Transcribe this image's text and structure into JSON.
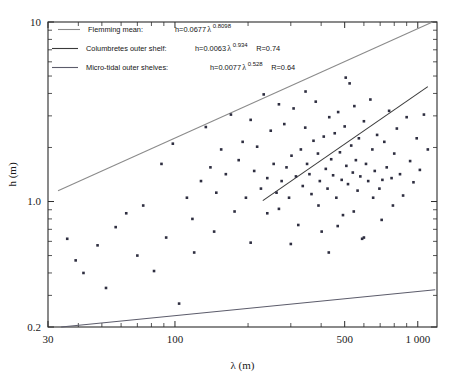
{
  "figure": {
    "background": "#ffffff",
    "frame_color": "#2b2b2b"
  },
  "chart_data": {
    "type": "scatter",
    "title": "",
    "xlabel": "λ (m)",
    "ylabel": "h (m)",
    "xscale": "log",
    "yscale": "log",
    "xlim": [
      30,
      1200
    ],
    "ylim": [
      0.2,
      10
    ],
    "grid": false,
    "xticklabels": [
      "30",
      "100",
      "500",
      "1 000"
    ],
    "xtickvalues": [
      30,
      100,
      500,
      1000
    ],
    "yticklabels": [
      "10",
      "1.0",
      "0.2"
    ],
    "ytickvalues": [
      10,
      1.0,
      0.2
    ],
    "legend_position": "top-left",
    "series": [
      {
        "name": "Flemming mean",
        "type": "line",
        "color": "#8a8a8a",
        "equation": "h=0.0677 λ",
        "exponent": "0.8098",
        "coefficient": 0.0677,
        "r_value": "",
        "x_start": 33,
        "x_end": 1150
      },
      {
        "name": "Columbretes outer shelf",
        "type": "line",
        "color": "#3a3a3a",
        "equation": "h=0.0063λ",
        "exponent": "0.934",
        "coefficient": 0.0063,
        "r_value": "R=0.74",
        "x_start": 230,
        "x_end": 1100
      },
      {
        "name": "Micro-tidal outer shelves",
        "type": "line",
        "color": "#5c5c6b",
        "equation": "h=0.0077 λ",
        "exponent": "0.528",
        "coefficient": 0.0077,
        "r_value": "R=0.64",
        "x_start": 34,
        "x_end": 1180
      },
      {
        "name": "data points",
        "type": "scatter",
        "color": "#2e2e40",
        "points": [
          [
            36,
            0.62
          ],
          [
            39,
            0.47
          ],
          [
            42,
            0.4
          ],
          [
            48,
            0.57
          ],
          [
            52,
            0.33
          ],
          [
            57,
            0.72
          ],
          [
            63,
            0.86
          ],
          [
            70,
            0.5
          ],
          [
            74,
            0.95
          ],
          [
            82,
            0.41
          ],
          [
            88,
            1.62
          ],
          [
            92,
            0.63
          ],
          [
            98,
            2.1
          ],
          [
            104,
            0.27
          ],
          [
            112,
            1.05
          ],
          [
            118,
            0.8
          ],
          [
            128,
            1.3
          ],
          [
            134,
            2.6
          ],
          [
            140,
            1.55
          ],
          [
            148,
            1.12
          ],
          [
            155,
            1.95
          ],
          [
            162,
            1.42
          ],
          [
            170,
            3.05
          ],
          [
            176,
            0.88
          ],
          [
            183,
            1.7
          ],
          [
            190,
            2.15
          ],
          [
            196,
            1.05
          ],
          [
            205,
            0.59
          ],
          [
            212,
            1.48
          ],
          [
            218,
            2.02
          ],
          [
            226,
            1.18
          ],
          [
            232,
            3.95
          ],
          [
            240,
            1.35
          ],
          [
            248,
            2.48
          ],
          [
            255,
            1.62
          ],
          [
            262,
            1.12
          ],
          [
            268,
            0.91
          ],
          [
            275,
            1.3
          ],
          [
            282,
            2.7
          ],
          [
            288,
            1.55
          ],
          [
            295,
            1.05
          ],
          [
            302,
            1.8
          ],
          [
            308,
            3.3
          ],
          [
            315,
            1.38
          ],
          [
            322,
            0.74
          ],
          [
            330,
            1.95
          ],
          [
            336,
            1.22
          ],
          [
            344,
            2.58
          ],
          [
            350,
            1.62
          ],
          [
            358,
            1.42
          ],
          [
            365,
            1.1
          ],
          [
            372,
            2.18
          ],
          [
            380,
            3.6
          ],
          [
            388,
            1.85
          ],
          [
            395,
            1.3
          ],
          [
            402,
            0.68
          ],
          [
            410,
            2.3
          ],
          [
            418,
            1.52
          ],
          [
            425,
            1.18
          ],
          [
            432,
            2.95
          ],
          [
            440,
            1.72
          ],
          [
            448,
            1.4
          ],
          [
            455,
            2.4
          ],
          [
            462,
            1.05
          ],
          [
            470,
            3.15
          ],
          [
            478,
            1.88
          ],
          [
            486,
            1.32
          ],
          [
            492,
            0.84
          ],
          [
            500,
            2.62
          ],
          [
            508,
            1.58
          ],
          [
            516,
            1.25
          ],
          [
            524,
            4.55
          ],
          [
            532,
            2.05
          ],
          [
            540,
            1.45
          ],
          [
            548,
            3.4
          ],
          [
            556,
            1.7
          ],
          [
            565,
            1.15
          ],
          [
            572,
            2.25
          ],
          [
            580,
            1.38
          ],
          [
            590,
            0.62
          ],
          [
            600,
            2.8
          ],
          [
            612,
            1.62
          ],
          [
            625,
            1.3
          ],
          [
            638,
            3.7
          ],
          [
            650,
            1.95
          ],
          [
            665,
            1.48
          ],
          [
            680,
            2.35
          ],
          [
            695,
            1.18
          ],
          [
            710,
            0.79
          ],
          [
            728,
            2.15
          ],
          [
            745,
            1.55
          ],
          [
            762,
            3.2
          ],
          [
            780,
            1.35
          ],
          [
            800,
            1.85
          ],
          [
            820,
            2.55
          ],
          [
            845,
            1.42
          ],
          [
            870,
            1.08
          ],
          [
            900,
            2.95
          ],
          [
            930,
            1.68
          ],
          [
            960,
            1.28
          ],
          [
            990,
            2.25
          ],
          [
            1020,
            1.5
          ],
          [
            1060,
            3.05
          ],
          [
            1100,
            1.95
          ],
          [
            120,
            0.52
          ],
          [
            145,
            0.68
          ],
          [
            205,
            2.85
          ],
          [
            240,
            0.86
          ],
          [
            268,
            3.48
          ],
          [
            300,
            0.58
          ],
          [
            345,
            4.1
          ],
          [
            390,
            0.95
          ],
          [
            430,
            0.52
          ],
          [
            468,
            0.73
          ],
          [
            505,
            4.9
          ],
          [
            545,
            0.88
          ],
          [
            600,
            0.63
          ],
          [
            655,
            1.05
          ],
          [
            715,
            1.32
          ],
          [
            790,
            0.95
          ]
        ]
      }
    ]
  },
  "legend": {
    "entries": [
      {
        "label": "Flemming mean:",
        "formula_head": "h=0.0677",
        "lambda": "λ",
        "exponent": "0.8098",
        "r": ""
      },
      {
        "label": "Columbretes outer shelf:",
        "formula_head": "h=0.0063",
        "lambda": "λ",
        "exponent": "0.934",
        "r": "R=0.74"
      },
      {
        "label": "Micro-tidal outer shelves:",
        "formula_head": "h=0.0077",
        "lambda": "λ",
        "exponent": "0.528",
        "r": "R=0.64"
      }
    ]
  }
}
